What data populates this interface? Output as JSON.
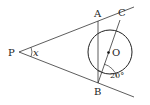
{
  "diagram": {
    "points": {
      "P": {
        "label": "P",
        "x": 19,
        "y": 52
      },
      "A": {
        "label": "A",
        "x": 98,
        "y": 21
      },
      "B": {
        "label": "B",
        "x": 98,
        "y": 83
      },
      "C": {
        "label": "C",
        "x": 120,
        "y": 20
      },
      "O": {
        "label": "O",
        "x": 108,
        "y": 52
      }
    },
    "circle": {
      "cx": 110,
      "cy": 52,
      "r": 22
    },
    "angles": {
      "x_label": "x",
      "deg_label": "20°"
    },
    "colors": {
      "stroke": "#333333",
      "text": "#222222"
    }
  }
}
